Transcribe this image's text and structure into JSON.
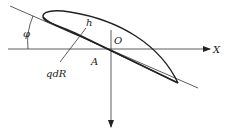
{
  "diagram": {
    "labels": {
      "phi": "φ",
      "h": "h",
      "origin": "O",
      "point_a": "A",
      "x_axis": "X",
      "force": "qdR"
    },
    "colors": {
      "stroke": "#222222",
      "background": "#ffffff"
    }
  }
}
